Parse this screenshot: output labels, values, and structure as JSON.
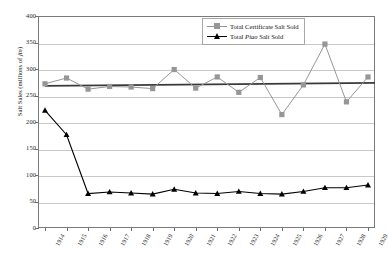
{
  "chart_data": {
    "type": "line",
    "title": "",
    "xlabel": "",
    "ylabel": "Salt Sales (millions of jin)",
    "ylabel_unit_italic": "jin",
    "ylim": [
      0,
      400
    ],
    "ytick_step": 50,
    "yticks": [
      "0",
      "50",
      "100",
      "150",
      "200",
      "250",
      "300",
      "350",
      "400"
    ],
    "grid": true,
    "legend_position": "top-right",
    "categories": [
      "1914",
      "1915",
      "1916",
      "1917",
      "1918",
      "1919",
      "1920",
      "1921",
      "1922",
      "1923",
      "1924",
      "1925",
      "1926",
      "1927",
      "1928",
      "1929"
    ],
    "series": [
      {
        "name": "Total Certificate Salt Sold",
        "marker": "square",
        "color": "#969696",
        "values": [
          272,
          283,
          262,
          267,
          266,
          263,
          299,
          264,
          285,
          256,
          284,
          214,
          270,
          347,
          238,
          285
        ]
      },
      {
        "name": "Total Piao Salt Sold",
        "marker": "triangle",
        "color": "#000000",
        "values": [
          222,
          176,
          65,
          68,
          66,
          64,
          73,
          66,
          65,
          69,
          65,
          64,
          69,
          76,
          76,
          81
        ]
      }
    ],
    "trendline": {
      "name": "Certificate Salt trendline",
      "color": "#3a3a3a",
      "start_value": 268,
      "end_value": 274
    }
  },
  "legend": {
    "items": [
      {
        "label_prefix": "Total Certificate Salt Sold",
        "label_italic": "",
        "label_suffix": ""
      },
      {
        "label_prefix": "Total ",
        "label_italic": "Piao",
        "label_suffix": " Salt Sold"
      }
    ]
  }
}
